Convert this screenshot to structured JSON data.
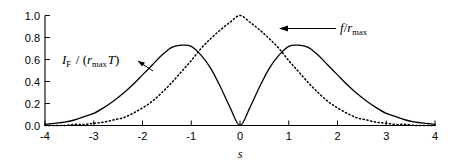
{
  "chart_data": {
    "type": "line",
    "title": "",
    "subtitle": "",
    "xlabel": "s",
    "ylabel": "",
    "xlim": [
      -4,
      4
    ],
    "ylim": [
      0.0,
      1.0
    ],
    "grid": false,
    "legend_position": "inline-annotations",
    "x_ticks": [
      "-4",
      "-3",
      "-2",
      "-1",
      "0",
      "1",
      "2",
      "3",
      "4"
    ],
    "x_tick_values": [
      -4,
      -3,
      -2,
      -1,
      0,
      1,
      2,
      3,
      4
    ],
    "y_ticks": [
      "0.0",
      "0.2",
      "0.4",
      "0.6",
      "0.8",
      "1.0"
    ],
    "y_tick_values": [
      0.0,
      0.2,
      0.4,
      0.6,
      0.8,
      1.0
    ],
    "series": [
      {
        "name": "I_F / (r_max T)",
        "style": "solid",
        "color": "#000000",
        "description": "Bimodal curve, zero at s=0, peaks ~0.73 at s = -1.41 and s = +1.41, decaying to 0 at s = +/-4",
        "x": [
          -4.0,
          -3.8,
          -3.6,
          -3.4,
          -3.2,
          -3.0,
          -2.8,
          -2.6,
          -2.4,
          -2.2,
          -2.0,
          -1.8,
          -1.6,
          -1.4,
          -1.2,
          -1.0,
          -0.8,
          -0.6,
          -0.4,
          -0.2,
          0.0,
          0.2,
          0.4,
          0.6,
          0.8,
          1.0,
          1.2,
          1.4,
          1.6,
          1.8,
          2.0,
          2.2,
          2.4,
          2.6,
          2.8,
          3.0,
          3.2,
          3.4,
          3.6,
          3.8,
          4.0
        ],
        "values": [
          0.01,
          0.02,
          0.03,
          0.05,
          0.08,
          0.11,
          0.16,
          0.22,
          0.29,
          0.37,
          0.46,
          0.55,
          0.64,
          0.71,
          0.73,
          0.72,
          0.64,
          0.52,
          0.35,
          0.16,
          0.0,
          0.16,
          0.35,
          0.52,
          0.64,
          0.72,
          0.73,
          0.71,
          0.64,
          0.55,
          0.46,
          0.37,
          0.29,
          0.22,
          0.16,
          0.11,
          0.08,
          0.05,
          0.03,
          0.02,
          0.01
        ]
      },
      {
        "name": "f / r_max",
        "style": "dotted",
        "color": "#000000",
        "description": "Unimodal bell curve peaking at 1.0 at s=0, decaying to 0 at s = +/-4",
        "x": [
          -4.0,
          -3.8,
          -3.6,
          -3.4,
          -3.2,
          -3.0,
          -2.8,
          -2.6,
          -2.4,
          -2.2,
          -2.0,
          -1.8,
          -1.6,
          -1.4,
          -1.2,
          -1.0,
          -0.8,
          -0.6,
          -0.4,
          -0.2,
          0.0,
          0.2,
          0.4,
          0.6,
          0.8,
          1.0,
          1.2,
          1.4,
          1.6,
          1.8,
          2.0,
          2.2,
          2.4,
          2.6,
          2.8,
          3.0,
          3.2,
          3.4,
          3.6,
          3.8,
          4.0
        ],
        "values": [
          0.0,
          0.0,
          0.0,
          0.01,
          0.01,
          0.02,
          0.03,
          0.05,
          0.07,
          0.11,
          0.16,
          0.22,
          0.3,
          0.39,
          0.49,
          0.59,
          0.7,
          0.79,
          0.87,
          0.94,
          1.0,
          0.94,
          0.87,
          0.79,
          0.7,
          0.59,
          0.49,
          0.39,
          0.3,
          0.22,
          0.16,
          0.11,
          0.07,
          0.05,
          0.03,
          0.02,
          0.01,
          0.01,
          0.0,
          0.0,
          0.0
        ]
      }
    ],
    "annotations": [
      {
        "id": "annotation-if",
        "label_base": "I",
        "label_sub": "F",
        "label_mid": " / (r",
        "label_sub2": "max",
        "label_tail": "T)",
        "full_text": "I_F / (r_max T)",
        "target_series": "I_F / (r_max T)",
        "arrow": "points right-down to solid curve"
      },
      {
        "id": "annotation-f",
        "label_base": "f/r",
        "label_sub": "max",
        "full_text": "f/r_max",
        "target_series": "f / r_max",
        "arrow": "points left to dotted curve"
      }
    ]
  },
  "axes": {
    "x_axis_label": "s",
    "y_axis_label": ""
  },
  "colors": {
    "background": "#ffffff",
    "axis": "#000000",
    "solid_curve": "#000000",
    "dotted_curve": "#000000",
    "text": "#000000"
  }
}
